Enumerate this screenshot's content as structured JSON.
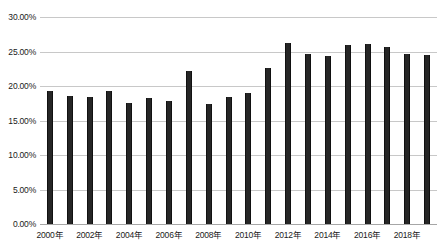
{
  "chart_data": {
    "type": "bar",
    "title": "",
    "subtitle": "",
    "xlabel": "",
    "ylabel": "",
    "categories": [
      "2000年",
      "2001年",
      "2002年",
      "2003年",
      "2004年",
      "2005年",
      "2006年",
      "2007年",
      "2008年",
      "2009年",
      "2010年",
      "2011年",
      "2012年",
      "2013年",
      "2014年",
      "2015年",
      "2016年",
      "2017年",
      "2018年",
      "2019年"
    ],
    "values": [
      19.3,
      18.6,
      18.4,
      19.3,
      17.6,
      18.2,
      17.9,
      22.2,
      17.4,
      18.4,
      19.0,
      22.6,
      26.2,
      24.7,
      24.4,
      25.9,
      26.1,
      25.7,
      24.6,
      24.5
    ],
    "value_suffix": "%",
    "ylim": [
      0,
      30
    ],
    "ytick_values": [
      0,
      5,
      10,
      15,
      20,
      25,
      30
    ],
    "ytick_labels": [
      "0.00%",
      "5.00%",
      "10.00%",
      "15.00%",
      "20.00%",
      "25.00%",
      "30.00%"
    ],
    "xtick_labels": [
      "2000年",
      "2002年",
      "2004年",
      "2006年",
      "2008年",
      "2010年",
      "2012年",
      "2014年",
      "2016年",
      "2018年"
    ],
    "xtick_indices": [
      0,
      2,
      4,
      6,
      8,
      10,
      12,
      14,
      16,
      18
    ],
    "grid": true,
    "grid_axis": "y",
    "legend": false,
    "legend_position": "none",
    "series": [
      {
        "name": "",
        "color": "#262626",
        "values": [
          19.3,
          18.6,
          18.4,
          19.3,
          17.6,
          18.2,
          17.9,
          22.2,
          17.4,
          18.4,
          19.0,
          22.6,
          26.2,
          24.7,
          24.4,
          25.9,
          26.1,
          25.7,
          24.6,
          24.5
        ]
      }
    ],
    "colors": {
      "bar": "#262626",
      "gridline": "#c8c8c8",
      "axis": "#a6a6a6",
      "text": "#1a1a1a",
      "background": "#ffffff"
    }
  }
}
